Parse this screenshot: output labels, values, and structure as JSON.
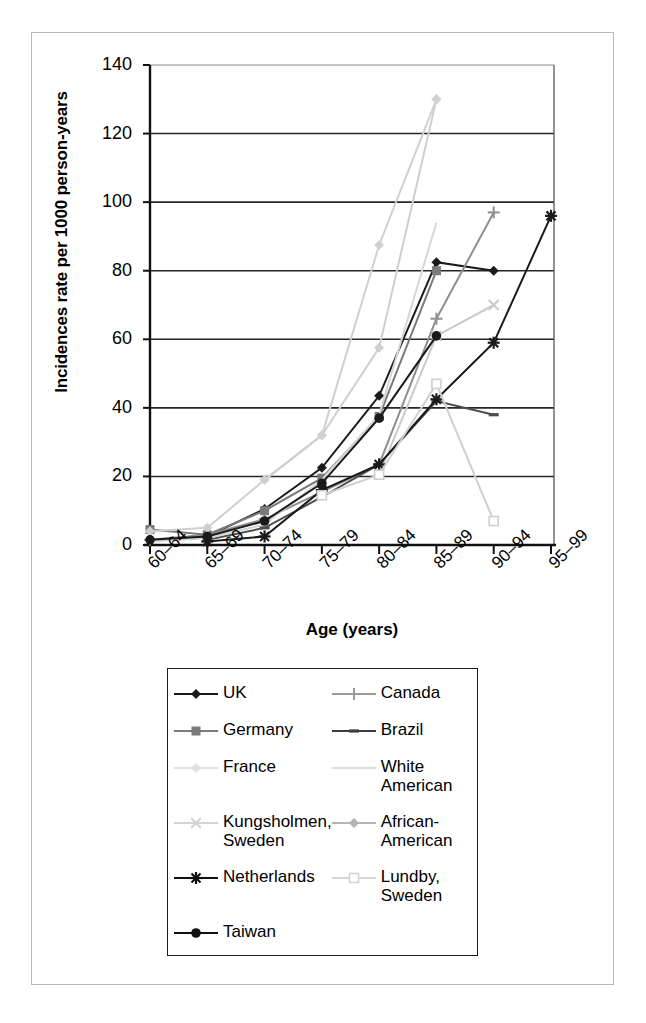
{
  "figure": {
    "frame_color": "#b9b9b9"
  },
  "chart_data": {
    "type": "line",
    "title": "",
    "xlabel": "Age (years)",
    "ylabel": "Incidences rate per 1000 person-years",
    "categories": [
      "60–64",
      "65–69",
      "70–74",
      "75–79",
      "80–84",
      "85–89",
      "90–94",
      "95–99"
    ],
    "ylim": [
      0,
      140
    ],
    "yticks": [
      0,
      20,
      40,
      60,
      80,
      100,
      120,
      140
    ],
    "grid": "horizontal",
    "legend_position": "below-plot",
    "series": [
      {
        "name": "UK",
        "marker": "filled-diamond",
        "color": "#1a1a1a",
        "x": [
          "65–69",
          "70–74",
          "75–79",
          "80–84",
          "85–89",
          "90–94"
        ],
        "values": [
          2.5,
          10.5,
          22.5,
          43.5,
          82.5,
          80.0
        ]
      },
      {
        "name": "Canada",
        "marker": "plus",
        "color": "#8f8f8f",
        "x": [
          "60–64",
          "65–69",
          "70–74",
          "75–79",
          "80–84",
          "85–89",
          "90–94"
        ],
        "values": [
          1.5,
          3.0,
          7.5,
          15.5,
          23.5,
          66.0,
          97.0
        ]
      },
      {
        "name": "Germany",
        "marker": "filled-square",
        "color": "#7a7a7a",
        "x": [
          "60–64",
          "65–69",
          "70–74",
          "75–79",
          "80–84",
          "85–89"
        ],
        "values": [
          4.5,
          3.0,
          10.0,
          19.5,
          37.5,
          80.0
        ]
      },
      {
        "name": "Brazil",
        "marker": "dash",
        "color": "#4d4d4d",
        "x": [
          "65–69",
          "70–74",
          "75–79",
          "80–84",
          "85–89",
          "90–94"
        ],
        "values": [
          1.5,
          5.0,
          14.0,
          23.5,
          42.0,
          38.0
        ]
      },
      {
        "name": "France",
        "marker": "light-diamond",
        "color": "#cfcfcf",
        "x": [
          "60–64",
          "65–69",
          "70–74",
          "75–79",
          "80–84",
          "85–89"
        ],
        "values": [
          4.0,
          5.0,
          19.0,
          32.0,
          57.5,
          130.0
        ]
      },
      {
        "name": "White American",
        "marker": "none",
        "color": "#d6d6d6",
        "x": [
          "60–64",
          "65–69",
          "70–74",
          "75–79",
          "80–84",
          "85–89"
        ],
        "values": [
          1.0,
          2.0,
          6.0,
          19.0,
          38.0,
          94.0
        ]
      },
      {
        "name": "Kungsholmen, Sweden",
        "marker": "light-x",
        "color": "#cacaca",
        "x": [
          "80–84",
          "85–89",
          "90–94"
        ],
        "values": [
          20.5,
          61.0,
          70.0
        ]
      },
      {
        "name": "African-American",
        "marker": "light-diamond",
        "color": "#d0d0d0",
        "x": [
          "70–74",
          "75–79",
          "80–84",
          "85–89"
        ],
        "values": [
          19.0,
          32.0,
          87.5,
          130.0
        ]
      },
      {
        "name": "Netherlands",
        "marker": "star",
        "color": "#1a1a1a",
        "x": [
          "65–69",
          "70–74",
          "75–79",
          "80–84",
          "85–89",
          "90–94",
          "95–99"
        ],
        "values": [
          1.0,
          2.5,
          16.0,
          23.5,
          42.5,
          59.0,
          96.0
        ]
      },
      {
        "name": "Lundby, Sweden",
        "marker": "open-square",
        "color": "#cfcfcf",
        "x": [
          "75–79",
          "80–84",
          "85–89",
          "90–94"
        ],
        "values": [
          14.5,
          20.5,
          47.0,
          7.0
        ]
      },
      {
        "name": "Taiwan",
        "marker": "filled-circle",
        "color": "#1a1a1a",
        "x": [
          "60–64",
          "65–69",
          "70–74",
          "75–79",
          "80–84",
          "85–89"
        ],
        "values": [
          1.5,
          2.5,
          7.0,
          18.0,
          37.0,
          61.0
        ]
      }
    ]
  },
  "legend": {
    "items": [
      {
        "label": "UK",
        "marker": "filled-diamond",
        "color": "#1a1a1a"
      },
      {
        "label": "Canada",
        "marker": "plus",
        "color": "#9a9a9a"
      },
      {
        "label": "Germany",
        "marker": "filled-square",
        "color": "#7a7a7a"
      },
      {
        "label": "Brazil",
        "marker": "dash",
        "color": "#3d3d3d"
      },
      {
        "label": "France",
        "marker": "light-diamond",
        "color": "#e2e2e2"
      },
      {
        "label": "White American",
        "marker": "none",
        "color": "#dcdcdc"
      },
      {
        "label": "Kungsholmen, Sweden",
        "marker": "light-x",
        "color": "#d4d4d4"
      },
      {
        "label": "African-American",
        "marker": "light-diamond",
        "color": "#b4b4b4"
      },
      {
        "label": "Netherlands",
        "marker": "star",
        "color": "#111111"
      },
      {
        "label": "Lundby, Sweden",
        "marker": "open-square",
        "color": "#d4d4d4"
      },
      {
        "label": "Taiwan",
        "marker": "filled-circle",
        "color": "#111111"
      }
    ]
  }
}
